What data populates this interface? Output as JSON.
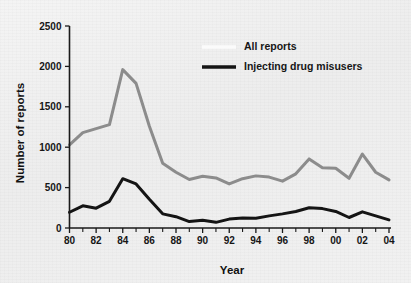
{
  "chart_data": {
    "type": "line",
    "title": "",
    "xlabel": "Year",
    "ylabel": "Number of reports",
    "xlim": [
      1980,
      2004
    ],
    "ylim": [
      0,
      2500
    ],
    "ytick_values": [
      0,
      500,
      1000,
      1500,
      2000,
      2500
    ],
    "ytick_labels": [
      "0",
      "500",
      "1000",
      "1500",
      "2000",
      "2500"
    ],
    "xtick_values": [
      1980,
      1982,
      1984,
      1986,
      1988,
      1990,
      1992,
      1994,
      1996,
      1998,
      2000,
      2002,
      2004
    ],
    "xtick_labels": [
      "80",
      "82",
      "84",
      "86",
      "88",
      "90",
      "92",
      "94",
      "96",
      "98",
      "00",
      "02",
      "04"
    ],
    "x": [
      1980,
      1981,
      1982,
      1983,
      1984,
      1985,
      1986,
      1987,
      1988,
      1989,
      1990,
      1991,
      1992,
      1993,
      1994,
      1995,
      1996,
      1997,
      1998,
      1999,
      2000,
      2001,
      2002,
      2003,
      2004
    ],
    "grid": false,
    "legend_position": "top-center",
    "series": [
      {
        "name": "All reports",
        "color": "#8c8c8c",
        "legend_swatch_color": "#fbfbfb",
        "line_width": 3.0,
        "values": [
          1030,
          1180,
          1230,
          1280,
          1960,
          1790,
          1260,
          800,
          690,
          600,
          640,
          620,
          545,
          610,
          645,
          630,
          580,
          670,
          855,
          745,
          740,
          615,
          915,
          690,
          595
        ]
      },
      {
        "name": "Injecting drug misusers",
        "color": "#141414",
        "legend_swatch_color": "#141414",
        "line_width": 3.0,
        "values": [
          195,
          275,
          245,
          330,
          610,
          545,
          355,
          175,
          140,
          80,
          95,
          70,
          110,
          125,
          120,
          150,
          175,
          205,
          250,
          240,
          205,
          130,
          200,
          150,
          100
        ]
      }
    ]
  },
  "figure": {
    "background_color": "#f0f0f0",
    "axis_color": "#1a1a1a"
  }
}
